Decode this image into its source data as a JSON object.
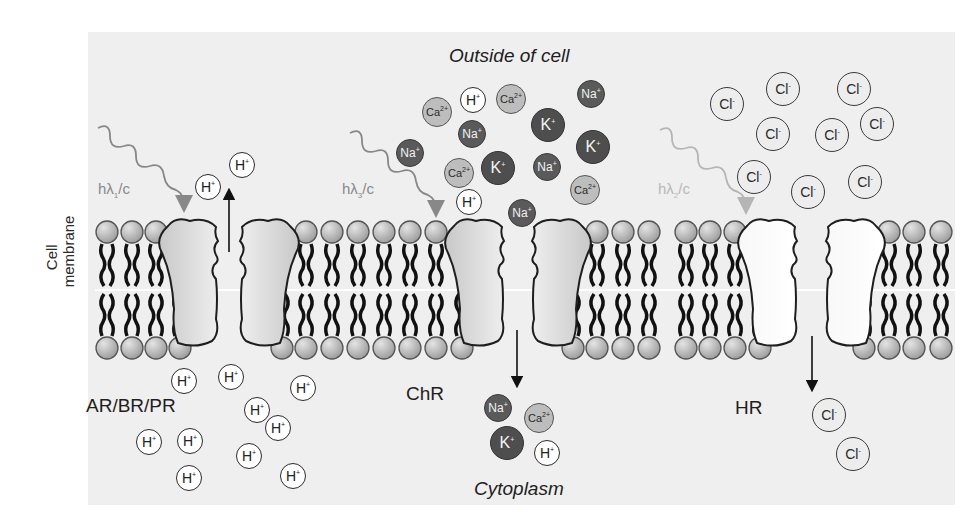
{
  "diagram": {
    "type": "cell membrane light-activated ion channels/pumps",
    "regions": {
      "outside_label": "Outside of cell",
      "inside_label": "Cytoplasm",
      "membrane_label_line1": "Cell",
      "membrane_label_line2": "membrane"
    },
    "proteins": [
      {
        "id": "pump",
        "label": "AR/BR/PR",
        "photon": {
          "prefix": "hλ",
          "subscript": "1",
          "suffix": "/c"
        },
        "transported_ion": "H+",
        "direction": "inside-to-outside"
      },
      {
        "id": "chr",
        "label": "ChR",
        "photon": {
          "prefix": "hλ",
          "subscript": "3",
          "suffix": "/c"
        },
        "transported_ions": [
          "Na+",
          "K+",
          "Ca2+",
          "H+"
        ],
        "direction": "outside-to-inside"
      },
      {
        "id": "hr",
        "label": "HR",
        "photon": {
          "prefix": "hλ",
          "subscript": "2",
          "suffix": "/c"
        },
        "transported_ion": "Cl-",
        "direction": "outside-to-inside"
      }
    ],
    "ion_types": {
      "H": {
        "symbol": "H",
        "charge": "+",
        "fill": "#ffffff"
      },
      "Na": {
        "symbol": "Na",
        "charge": "+",
        "fill": "#5a5a5a"
      },
      "K": {
        "symbol": "K",
        "charge": "+",
        "fill": "#4e4e4e"
      },
      "Ca": {
        "symbol": "Ca",
        "charge": "2+",
        "fill": "#bdbdbd"
      },
      "Cl": {
        "symbol": "Cl",
        "charge": "-",
        "fill": "#ededed"
      }
    },
    "ions": [
      {
        "type": "H",
        "x": 195,
        "y": 174
      },
      {
        "type": "H",
        "x": 229,
        "y": 152
      },
      {
        "type": "Ca",
        "x": 422,
        "y": 97
      },
      {
        "type": "H",
        "x": 460,
        "y": 87
      },
      {
        "type": "Ca",
        "x": 496,
        "y": 84
      },
      {
        "type": "Na",
        "x": 577,
        "y": 80
      },
      {
        "type": "Na",
        "x": 458,
        "y": 120
      },
      {
        "type": "K",
        "x": 531,
        "y": 108
      },
      {
        "type": "Na",
        "x": 396,
        "y": 139
      },
      {
        "type": "K",
        "x": 576,
        "y": 130
      },
      {
        "type": "Ca",
        "x": 444,
        "y": 158
      },
      {
        "type": "K",
        "x": 481,
        "y": 151
      },
      {
        "type": "Na",
        "x": 533,
        "y": 153
      },
      {
        "type": "Ca",
        "x": 570,
        "y": 175
      },
      {
        "type": "H",
        "x": 456,
        "y": 189
      },
      {
        "type": "Na",
        "x": 508,
        "y": 199
      },
      {
        "type": "Cl",
        "x": 710,
        "y": 87
      },
      {
        "type": "Cl",
        "x": 766,
        "y": 72
      },
      {
        "type": "Cl",
        "x": 837,
        "y": 72
      },
      {
        "type": "Cl",
        "x": 756,
        "y": 117
      },
      {
        "type": "Cl",
        "x": 815,
        "y": 118
      },
      {
        "type": "Cl",
        "x": 860,
        "y": 107
      },
      {
        "type": "Cl",
        "x": 737,
        "y": 160
      },
      {
        "type": "Cl",
        "x": 791,
        "y": 175
      },
      {
        "type": "Cl",
        "x": 848,
        "y": 165
      },
      {
        "type": "H",
        "x": 171,
        "y": 368
      },
      {
        "type": "H",
        "x": 218,
        "y": 364
      },
      {
        "type": "H",
        "x": 290,
        "y": 375
      },
      {
        "type": "H",
        "x": 244,
        "y": 397
      },
      {
        "type": "H",
        "x": 265,
        "y": 415
      },
      {
        "type": "H",
        "x": 136,
        "y": 429
      },
      {
        "type": "H",
        "x": 177,
        "y": 428
      },
      {
        "type": "H",
        "x": 236,
        "y": 443
      },
      {
        "type": "H",
        "x": 176,
        "y": 465
      },
      {
        "type": "H",
        "x": 280,
        "y": 463
      },
      {
        "type": "Na",
        "x": 484,
        "y": 394
      },
      {
        "type": "Ca",
        "x": 524,
        "y": 403
      },
      {
        "type": "K",
        "x": 490,
        "y": 426
      },
      {
        "type": "H",
        "x": 534,
        "y": 440
      },
      {
        "type": "Cl",
        "x": 812,
        "y": 398
      },
      {
        "type": "Cl",
        "x": 836,
        "y": 437
      }
    ]
  }
}
